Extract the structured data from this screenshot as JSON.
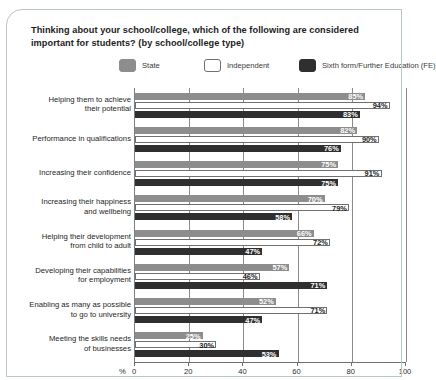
{
  "ghost_text": "partially cropped text above chart",
  "chart_data": {
    "type": "bar",
    "orientation": "horizontal",
    "title": "Thinking about your school/college, which of the following are considered important for students? (by school/college type)",
    "xlabel": "%",
    "ylabel": "",
    "xlim": [
      0,
      100
    ],
    "xticks": [
      0,
      20,
      40,
      60,
      80,
      100
    ],
    "grid": false,
    "legend_position": "top",
    "categories": [
      "Helping them to achieve their potential",
      "Performance in qualifications",
      "Increasing their confidence",
      "Increasing their happiness and wellbeing",
      "Helping their development from child to adult",
      "Developing their capabilities for employment",
      "Enabling as many as possible to go to university",
      "Meeting the skills needs of businesses"
    ],
    "category_lines": [
      [
        "Helping them to achieve",
        "their potential"
      ],
      [
        "Performance in qualifications"
      ],
      [
        "Increasing their confidence"
      ],
      [
        "Increasing their happiness",
        "and wellbeing"
      ],
      [
        "Helping their development",
        "from child to adult"
      ],
      [
        "Developing their capabilities",
        "for employment"
      ],
      [
        "Enabling as many as possible",
        "to go to university"
      ],
      [
        "Meeting the skills needs",
        "of businesses"
      ]
    ],
    "series": [
      {
        "name": "State",
        "color": "#8d8d8d",
        "values": [
          85,
          82,
          75,
          70,
          66,
          57,
          52,
          25
        ],
        "labels": [
          "85%",
          "82%",
          "75%",
          "70%",
          "66%",
          "57%",
          "52%",
          "25%"
        ]
      },
      {
        "name": "Independent",
        "color": "#ffffff",
        "values": [
          94,
          90,
          91,
          79,
          72,
          46,
          71,
          30
        ],
        "labels": [
          "94%",
          "90%",
          "91%",
          "79%",
          "72%",
          "46%",
          "71%",
          "30%"
        ]
      },
      {
        "name": "Sixth form/Further Education (FE)",
        "color": "#2f2f2f",
        "values": [
          83,
          76,
          75,
          58,
          47,
          71,
          47,
          53
        ],
        "labels": [
          "83%",
          "76%",
          "75%",
          "58%",
          "47%",
          "71%",
          "47%",
          "53%"
        ]
      }
    ]
  }
}
